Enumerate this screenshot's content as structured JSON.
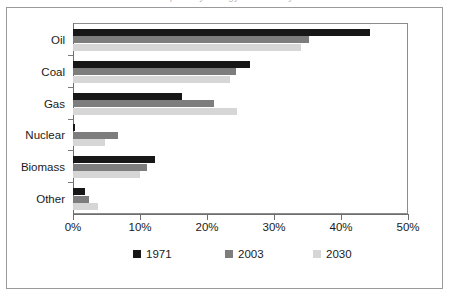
{
  "figure": {
    "title": "Global primary energy demand by fuel",
    "outer_border_color": "#9a9a9a",
    "background": "#ffffff"
  },
  "chart_data": {
    "type": "bar",
    "orientation": "horizontal",
    "title": "Global primary energy demand by fuel",
    "xlabel": "",
    "ylabel": "",
    "categories": [
      "Oil",
      "Coal",
      "Gas",
      "Nuclear",
      "Biomass",
      "Other"
    ],
    "series": [
      {
        "name": "1971",
        "color": "#171717",
        "values": [
          44.3,
          26.4,
          16.3,
          0.3,
          12.2,
          1.8
        ]
      },
      {
        "name": "2003",
        "color": "#7d7d7d",
        "values": [
          35.2,
          24.4,
          21.0,
          6.7,
          11.0,
          2.4
        ]
      },
      {
        "name": "2030",
        "color": "#d6d6d6",
        "values": [
          34.0,
          23.4,
          24.5,
          4.8,
          10.0,
          3.7
        ]
      }
    ],
    "xlim": [
      0,
      50
    ],
    "xticks": [
      0,
      10,
      20,
      30,
      40,
      50
    ],
    "xtick_labels": [
      "0%",
      "10%",
      "20%",
      "30%",
      "40%",
      "50%"
    ],
    "grid": false,
    "legend_position": "bottom",
    "legend_entries": [
      "1971",
      "2003",
      "2030"
    ]
  }
}
